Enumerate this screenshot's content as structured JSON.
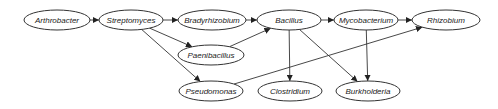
{
  "diagram": {
    "type": "directed-graph",
    "colors": {
      "stroke": "#333333",
      "text": "#222222",
      "fill": "#ffffff",
      "background": "#ffffff"
    },
    "nodes": [
      {
        "id": "arthrobacter",
        "label": "Arthrobacter",
        "cx": 57,
        "cy": 20,
        "rx": 33,
        "ry": 10
      },
      {
        "id": "streptomyces",
        "label": "Streptomyces",
        "cx": 131,
        "cy": 20,
        "rx": 32,
        "ry": 10
      },
      {
        "id": "bradyrhizobium",
        "label": "Bradyrhizobium",
        "cx": 212,
        "cy": 20,
        "rx": 34,
        "ry": 10
      },
      {
        "id": "bacillus",
        "label": "Bacillus",
        "cx": 289,
        "cy": 20,
        "rx": 32,
        "ry": 10
      },
      {
        "id": "mycobacterium",
        "label": "Mycobacterium",
        "cx": 366,
        "cy": 20,
        "rx": 32,
        "ry": 10
      },
      {
        "id": "rhizobium",
        "label": "Rhizobium",
        "cx": 446,
        "cy": 20,
        "rx": 34,
        "ry": 10
      },
      {
        "id": "paenibacillus",
        "label": "Paenibacillus",
        "cx": 211,
        "cy": 55,
        "rx": 33,
        "ry": 10
      },
      {
        "id": "pseudomonas",
        "label": "Pseudomonas",
        "cx": 211,
        "cy": 91,
        "rx": 32,
        "ry": 10
      },
      {
        "id": "clostridium",
        "label": "Clostridium",
        "cx": 290,
        "cy": 91,
        "rx": 32,
        "ry": 10
      },
      {
        "id": "burkholderia",
        "label": "Burkholderia",
        "cx": 368,
        "cy": 91,
        "rx": 32,
        "ry": 10
      }
    ],
    "edges": [
      {
        "from": "arthrobacter",
        "to": "streptomyces"
      },
      {
        "from": "streptomyces",
        "to": "bradyrhizobium"
      },
      {
        "from": "bradyrhizobium",
        "to": "bacillus"
      },
      {
        "from": "bacillus",
        "to": "mycobacterium"
      },
      {
        "from": "mycobacterium",
        "to": "rhizobium"
      },
      {
        "from": "streptomyces",
        "to": "paenibacillus"
      },
      {
        "from": "streptomyces",
        "to": "pseudomonas"
      },
      {
        "from": "paenibacillus",
        "to": "bacillus"
      },
      {
        "from": "bacillus",
        "to": "clostridium"
      },
      {
        "from": "bacillus",
        "to": "burkholderia"
      },
      {
        "from": "mycobacterium",
        "to": "burkholderia"
      },
      {
        "from": "pseudomonas",
        "to": "rhizobium"
      }
    ]
  }
}
